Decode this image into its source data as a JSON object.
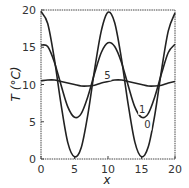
{
  "chart_data": {
    "type": "line",
    "title": "",
    "xlabel": "x",
    "ylabel": "T (°C)",
    "xlim": [
      0,
      20
    ],
    "ylim": [
      0,
      20
    ],
    "xticks": [
      "0",
      "5",
      "10",
      "15",
      "20"
    ],
    "yticks": [
      "0",
      "5",
      "10",
      "15",
      "20"
    ],
    "grid": false,
    "legend": "inline curve labels",
    "series": [
      {
        "name": "0",
        "label_pos": [
          15.9,
          4.1
        ],
        "x": [
          0,
          1,
          2,
          3,
          4,
          5,
          6,
          7,
          8,
          9,
          10,
          11,
          12,
          13,
          14,
          15,
          16,
          17,
          18,
          19,
          20
        ],
        "values": [
          19.8,
          18.2,
          13.4,
          7.3,
          2.2,
          0.3,
          1.5,
          6.0,
          12.0,
          17.2,
          19.7,
          18.3,
          13.5,
          7.4,
          2.3,
          0.3,
          1.6,
          6.0,
          12.0,
          17.2,
          19.6
        ]
      },
      {
        "name": "1",
        "label_pos": [
          15.1,
          6.2
        ],
        "x": [
          0,
          1,
          2,
          3,
          4,
          5,
          6,
          7,
          8,
          9,
          10,
          11,
          12,
          13,
          14,
          15,
          16,
          17,
          18,
          19,
          20
        ],
        "values": [
          15.3,
          15.1,
          13.0,
          9.9,
          7.0,
          5.6,
          6.1,
          8.4,
          11.5,
          14.3,
          15.6,
          15.1,
          13.0,
          9.9,
          7.0,
          5.6,
          6.1,
          8.4,
          11.5,
          14.3,
          15.4
        ]
      },
      {
        "name": "5",
        "label_pos": [
          9.9,
          10.8
        ],
        "x": [
          0,
          1,
          2,
          3,
          4,
          5,
          6,
          7,
          8,
          9,
          10,
          11,
          12,
          13,
          14,
          15,
          16,
          17,
          18,
          19,
          20
        ],
        "values": [
          10.5,
          10.6,
          10.6,
          10.4,
          10.2,
          10.0,
          9.8,
          9.8,
          9.9,
          10.2,
          10.4,
          10.6,
          10.6,
          10.4,
          10.2,
          10.0,
          9.8,
          9.8,
          9.9,
          10.2,
          10.4
        ]
      }
    ]
  }
}
